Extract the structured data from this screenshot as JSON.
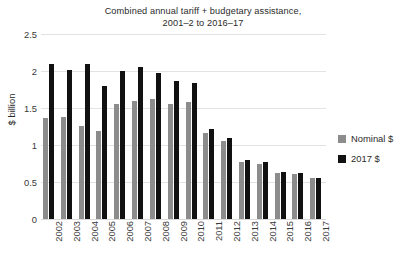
{
  "chart_data": {
    "type": "bar",
    "title": "Combined annual tariff + budgetary assistance, 2001–2 to 2016–17",
    "title_line1": "Combined annual tariff + budgetary assistance,",
    "title_line2": "2001–2 to 2016–17",
    "xlabel": "",
    "ylabel": "$ billion",
    "ylim": [
      0,
      2.5
    ],
    "yticks": [
      "0",
      "0.5",
      "1",
      "1.5",
      "2",
      "2.5"
    ],
    "ytick_values": [
      0,
      0.5,
      1,
      1.5,
      2,
      2.5
    ],
    "grid": true,
    "legend_position": "right",
    "categories": [
      "2002",
      "2003",
      "2004",
      "2005",
      "2006",
      "2007",
      "2008",
      "2009",
      "2010",
      "2011",
      "2012",
      "2013",
      "2014",
      "2015",
      "2016",
      "2017"
    ],
    "series": [
      {
        "name": "Nominal $",
        "color": "#8c8c8c",
        "values": [
          1.36,
          1.38,
          1.26,
          1.19,
          1.55,
          1.6,
          1.62,
          1.56,
          1.58,
          1.16,
          1.05,
          0.77,
          0.75,
          0.62,
          0.61,
          0.55
        ]
      },
      {
        "name": "2017 $",
        "color": "#111111",
        "values": [
          2.09,
          2.01,
          2.1,
          1.8,
          2.0,
          2.05,
          1.97,
          1.86,
          1.84,
          1.22,
          1.1,
          0.8,
          0.77,
          0.63,
          0.62,
          0.55
        ]
      }
    ]
  },
  "legend": {
    "items": [
      {
        "label": "Nominal $",
        "color": "#8c8c8c"
      },
      {
        "label": "2017 $",
        "color": "#111111"
      }
    ]
  }
}
